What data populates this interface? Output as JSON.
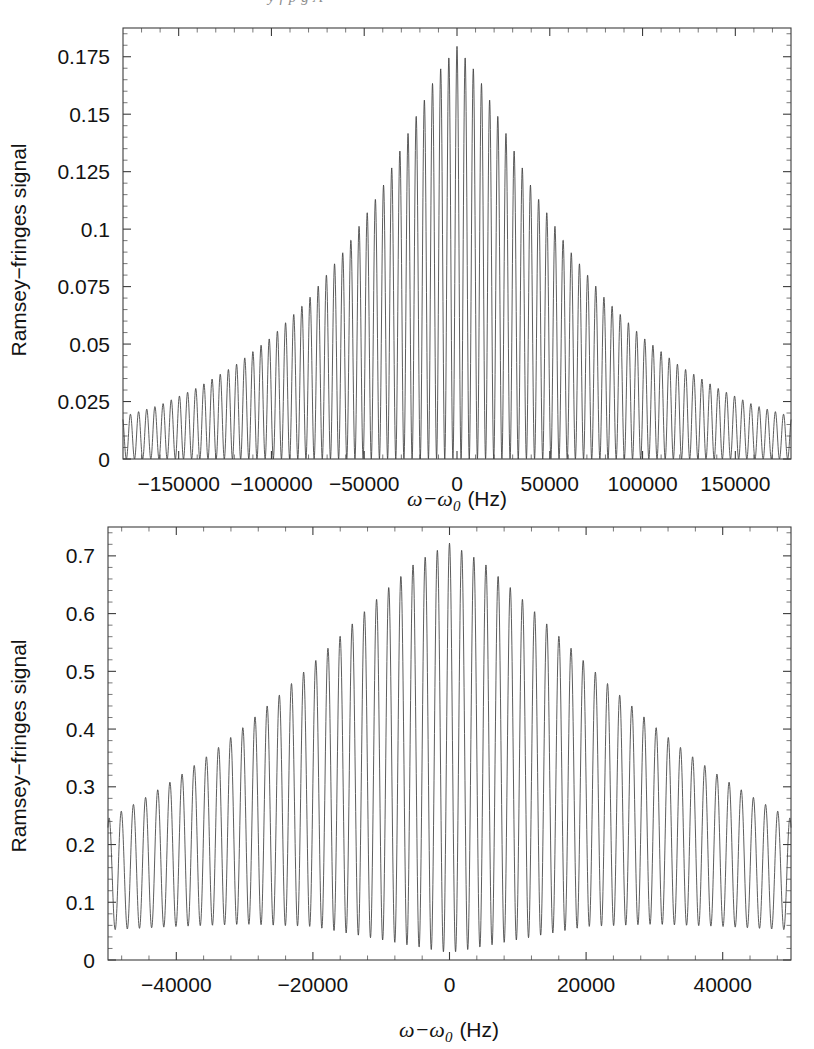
{
  "page_bleed_text": "y  f  p  g  A",
  "figure": {
    "background_color": "#ffffff",
    "line_color": "#404040",
    "axis_color": "#3c3c3c"
  },
  "chart_data": [
    {
      "id": "top-panel",
      "type": "line",
      "title": "",
      "xlabel": "ω−ω₀ (Hz)",
      "xlabel_parts": {
        "symbol": "ω−ω",
        "subscript": "0",
        "unit": "(Hz)"
      },
      "ylabel": "Ramsey−fringes signal",
      "xlim": [
        -180000,
        180000
      ],
      "ylim": [
        0,
        0.1875
      ],
      "xticks": [
        -150000,
        -100000,
        -50000,
        0,
        50000,
        100000,
        150000
      ],
      "xticklabels": [
        "−150000",
        "−100000",
        "−50000",
        "0",
        "50000",
        "100000",
        "150000"
      ],
      "yticks": [
        0,
        0.025,
        0.05,
        0.075,
        0.1,
        0.125,
        0.15,
        0.175
      ],
      "yticklabels": [
        "0",
        "0.025",
        "0.05",
        "0.075",
        "0.1",
        "0.125",
        "0.15",
        "0.175"
      ],
      "minor_ticks_per_interval": 4,
      "grid": false,
      "legend": false,
      "model": {
        "description": "Ramsey fringes: cos^2 interference fringes modulated by a peaked envelope centred at zero detuning",
        "fringe_period_hz": 4400,
        "fringe_phase_hz": 0,
        "envelope_peak": 0.1795,
        "envelope_floor": 0.0,
        "envelope_shape": "lorentzian-like cusp, half-width 78000 Hz",
        "envelope_halfwidth_hz": 78000,
        "baseline_at_edges": 0.018,
        "minima_value": 0.0,
        "samples": 3000
      },
      "envelope_points": {
        "x": [
          -180000,
          -160000,
          -140000,
          -120000,
          -100000,
          -80000,
          -60000,
          -40000,
          -20000,
          -10000,
          0,
          10000,
          20000,
          40000,
          60000,
          80000,
          100000,
          120000,
          140000,
          160000,
          180000
        ],
        "y": [
          0.0185,
          0.0235,
          0.031,
          0.0405,
          0.053,
          0.0695,
          0.0915,
          0.1185,
          0.1525,
          0.1685,
          0.1795,
          0.1685,
          0.1525,
          0.1185,
          0.0915,
          0.0695,
          0.053,
          0.0405,
          0.031,
          0.0235,
          0.0185
        ]
      }
    },
    {
      "id": "bottom-panel",
      "type": "line",
      "title": "",
      "xlabel": "ω−ω₀ (Hz)",
      "xlabel_parts": {
        "symbol": "ω−ω",
        "subscript": "0",
        "unit": "(Hz)"
      },
      "ylabel": "Ramsey−fringes signal",
      "xlim": [
        -50000,
        50000
      ],
      "ylim": [
        0,
        0.75
      ],
      "xticks": [
        -40000,
        -20000,
        0,
        20000,
        40000
      ],
      "xticklabels": [
        "−40000",
        "−20000",
        "0",
        "20000",
        "40000"
      ],
      "yticks": [
        0,
        0.1,
        0.2,
        0.3,
        0.4,
        0.5,
        0.6,
        0.7
      ],
      "yticklabels": [
        "0",
        "0.1",
        "0.2",
        "0.3",
        "0.4",
        "0.5",
        "0.6",
        "0.7"
      ],
      "minor_ticks_per_interval": 4,
      "grid": false,
      "legend": false,
      "model": {
        "description": "Ramsey fringes with broader envelope; fringe minima rise away from line centre",
        "fringe_period_hz": 1780,
        "fringe_phase_hz": 0,
        "envelope_peak": 0.722,
        "envelope_shape": "broad dome, gaussian-like, width 42000 Hz",
        "envelope_width_hz": 42000,
        "baseline_at_edges": 0.245,
        "minima_center": 0.012,
        "minima_at_edges": 0.052,
        "samples": 3000
      },
      "envelope_points": {
        "x": [
          -50000,
          -45000,
          -40000,
          -35000,
          -30000,
          -25000,
          -20000,
          -15000,
          -10000,
          -5000,
          0,
          5000,
          10000,
          15000,
          20000,
          25000,
          30000,
          35000,
          40000,
          45000,
          50000
        ],
        "y": [
          0.245,
          0.278,
          0.315,
          0.357,
          0.405,
          0.458,
          0.514,
          0.573,
          0.633,
          0.688,
          0.722,
          0.688,
          0.633,
          0.573,
          0.514,
          0.458,
          0.405,
          0.357,
          0.315,
          0.278,
          0.245
        ]
      },
      "lower_envelope_points": {
        "x": [
          -50000,
          -40000,
          -30000,
          -20000,
          -10000,
          0,
          10000,
          20000,
          30000,
          40000,
          50000
        ],
        "y": [
          0.052,
          0.058,
          0.062,
          0.058,
          0.035,
          0.012,
          0.035,
          0.058,
          0.062,
          0.058,
          0.052
        ]
      }
    }
  ]
}
